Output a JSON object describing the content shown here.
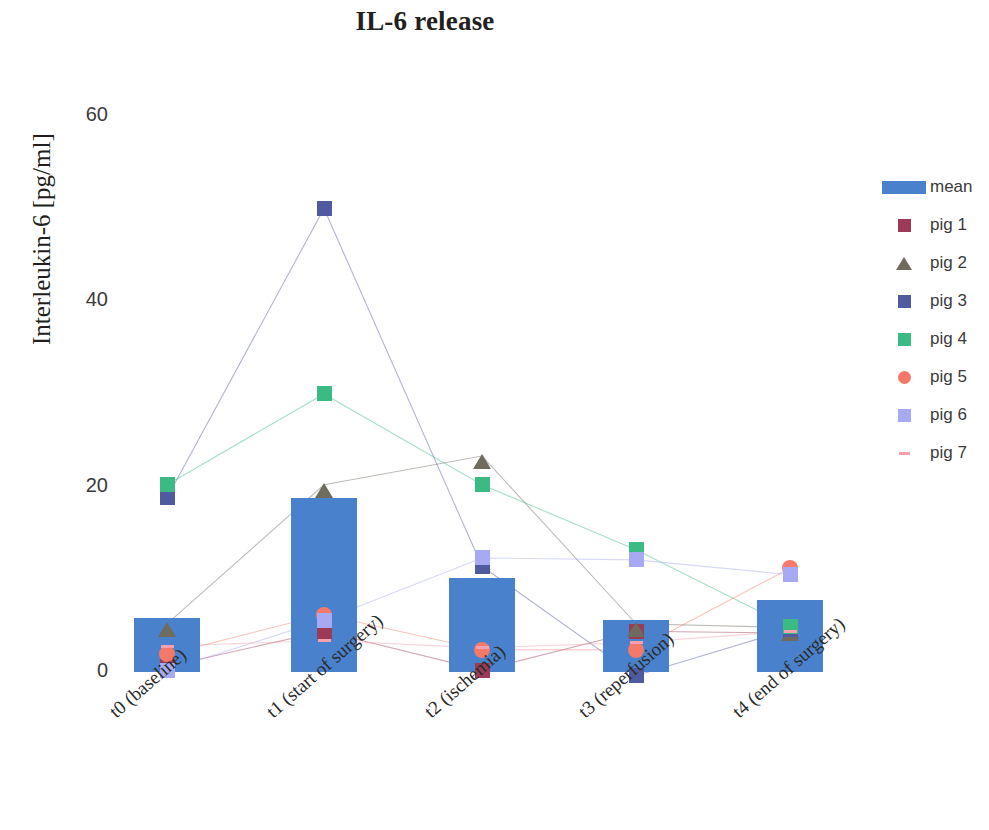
{
  "chart_data": {
    "type": "bar",
    "title": "IL-6 release",
    "xlabel": "",
    "ylabel": "Interleukin-6 [pg/ml]",
    "ylim": [
      0,
      60
    ],
    "yticks": [
      0,
      20,
      40,
      60
    ],
    "ytick_labels": [
      "0",
      "20",
      "40",
      "60"
    ],
    "grid": false,
    "legend_position": "right",
    "categories": [
      "t0 (baseline)",
      "t1 (start of surgery)",
      "t2 (ischemia)",
      "t3 (reperfusion)",
      "t4 (end of surgery)"
    ],
    "series": [
      {
        "name": "mean",
        "type": "bar",
        "color": "#4a81cd",
        "values": [
          5.8,
          18.8,
          10.1,
          5.6,
          7.8
        ]
      },
      {
        "name": "pig 1",
        "type": "scatter",
        "marker": "square",
        "color": "#9c3b57",
        "values": [
          0.6,
          4.4,
          0.2,
          4.4,
          4.2
        ]
      },
      {
        "name": "pig 2",
        "type": "scatter",
        "marker": "triangle",
        "color": "#6f6b5e",
        "values": [
          5.2,
          20.2,
          23.3,
          5.2,
          4.8
        ]
      },
      {
        "name": "pig 3",
        "type": "scatter",
        "marker": "square",
        "color": "#4f5aa0",
        "values": [
          18.8,
          50.0,
          11.4,
          -0.4,
          4.6
        ]
      },
      {
        "name": "pig 4",
        "type": "scatter",
        "marker": "square",
        "color": "#3bbb83",
        "values": [
          20.2,
          30.0,
          20.2,
          13.2,
          4.9
        ]
      },
      {
        "name": "pig 5",
        "type": "scatter",
        "marker": "circle",
        "color": "#f4796b",
        "values": [
          1.9,
          6.2,
          2.4,
          2.4,
          11.2
        ]
      },
      {
        "name": "pig 6",
        "type": "scatter",
        "marker": "square",
        "color": "#a7a9f2",
        "values": [
          0.2,
          5.6,
          12.3,
          12.1,
          10.5
        ]
      },
      {
        "name": "pig 7",
        "type": "scatter",
        "marker": "dash",
        "color": "#f5a0ae",
        "values": [
          2.8,
          3.4,
          2.6,
          3.2,
          4.4
        ]
      }
    ]
  },
  "legend": {
    "items": [
      {
        "label": "mean",
        "marker": "bar",
        "color": "#4a81cd"
      },
      {
        "label": "pig 1",
        "marker": "square",
        "color": "#9c3b57"
      },
      {
        "label": "pig 2",
        "marker": "triangle",
        "color": "#6f6b5e"
      },
      {
        "label": "pig 3",
        "marker": "square",
        "color": "#4f5aa0"
      },
      {
        "label": "pig 4",
        "marker": "square",
        "color": "#3bbb83"
      },
      {
        "label": "pig 5",
        "marker": "circle",
        "color": "#f4796b"
      },
      {
        "label": "pig 6",
        "marker": "square",
        "color": "#a7a9f2"
      },
      {
        "label": "pig 7",
        "marker": "dash",
        "color": "#f5a0ae"
      }
    ]
  }
}
